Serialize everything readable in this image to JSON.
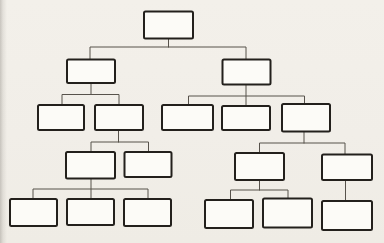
{
  "page": {
    "background_color": "#f1eee8",
    "scan_edge_shadow_color": "#b7b2aa"
  },
  "diagram": {
    "type": "tree",
    "title": "",
    "canvas": {
      "width": 384,
      "height": 243
    },
    "node_style": {
      "fill": "#fcfbf7",
      "stroke": "#23201c",
      "stroke_width": 2,
      "corner_radius": 1.5
    },
    "connector_style": {
      "stroke": "#57524b",
      "stroke_width": 1
    },
    "nodes": [
      {
        "id": "n1",
        "level": 1,
        "parent": null,
        "label": "",
        "x": 144,
        "y": 11.5,
        "w": 49,
        "h": 27
      },
      {
        "id": "n2",
        "level": 2,
        "parent": "n1",
        "label": "",
        "x": 67,
        "y": 59.5,
        "w": 48,
        "h": 23.5
      },
      {
        "id": "n3",
        "level": 2,
        "parent": "n1",
        "label": "",
        "x": 222.5,
        "y": 59.5,
        "w": 48,
        "h": 25
      },
      {
        "id": "n4",
        "level": 3,
        "parent": "n2",
        "label": "",
        "x": 38,
        "y": 105,
        "w": 46,
        "h": 25
      },
      {
        "id": "n5",
        "level": 3,
        "parent": "n2",
        "label": "",
        "x": 95,
        "y": 105,
        "w": 48,
        "h": 25
      },
      {
        "id": "n6",
        "level": 3,
        "parent": "n3",
        "label": "",
        "x": 162,
        "y": 105,
        "w": 51,
        "h": 25
      },
      {
        "id": "n7",
        "level": 3,
        "parent": "n3",
        "label": "",
        "x": 222,
        "y": 106,
        "w": 48,
        "h": 24
      },
      {
        "id": "n8",
        "level": 3,
        "parent": "n3",
        "label": "",
        "x": 282,
        "y": 104,
        "w": 48,
        "h": 27.5
      },
      {
        "id": "n9",
        "level": 4,
        "parent": "n5",
        "label": "",
        "x": 66,
        "y": 152,
        "w": 49,
        "h": 26.5
      },
      {
        "id": "n10",
        "level": 4,
        "parent": "n5",
        "label": "",
        "x": 124.5,
        "y": 152,
        "w": 47,
        "h": 25
      },
      {
        "id": "n11",
        "level": 4,
        "parent": "n8",
        "label": "",
        "x": 235,
        "y": 153,
        "w": 49,
        "h": 27
      },
      {
        "id": "n12",
        "level": 4,
        "parent": "n8",
        "label": "",
        "x": 322,
        "y": 154.5,
        "w": 50,
        "h": 25.5
      },
      {
        "id": "n13",
        "level": 5,
        "parent": "n9",
        "label": "",
        "x": 10,
        "y": 199,
        "w": 47,
        "h": 27
      },
      {
        "id": "n14",
        "level": 5,
        "parent": "n9",
        "label": "",
        "x": 67,
        "y": 199,
        "w": 47,
        "h": 26
      },
      {
        "id": "n15",
        "level": 5,
        "parent": "n9",
        "label": "",
        "x": 124,
        "y": 199,
        "w": 47,
        "h": 27
      },
      {
        "id": "n16",
        "level": 5,
        "parent": "n11",
        "label": "",
        "x": 205,
        "y": 200,
        "w": 48,
        "h": 28
      },
      {
        "id": "n17",
        "level": 5,
        "parent": "n11",
        "label": "",
        "x": 263,
        "y": 198.5,
        "w": 49,
        "h": 29
      },
      {
        "id": "n18",
        "level": 5,
        "parent": "n12",
        "label": "",
        "x": 322,
        "y": 201,
        "w": 50,
        "h": 29
      }
    ],
    "connectors": [
      {
        "name": "root-stem",
        "points": [
          [
            168.5,
            38.5
          ],
          [
            168.5,
            47
          ]
        ]
      },
      {
        "name": "root-bar",
        "points": [
          [
            90,
            59.5
          ],
          [
            90,
            47
          ],
          [
            246,
            47
          ],
          [
            246,
            59.5
          ]
        ]
      },
      {
        "name": "left2-stem",
        "points": [
          [
            91,
            83
          ],
          [
            91,
            94.5
          ]
        ]
      },
      {
        "name": "left2-bar",
        "points": [
          [
            62,
            105
          ],
          [
            62,
            94.5
          ],
          [
            119,
            94.5
          ],
          [
            119,
            105
          ]
        ]
      },
      {
        "name": "right2-stem",
        "points": [
          [
            246,
            84.5
          ],
          [
            246,
            106
          ]
        ]
      },
      {
        "name": "right2-bar",
        "points": [
          [
            188.5,
            105
          ],
          [
            188.5,
            96
          ],
          [
            304.5,
            96
          ],
          [
            304.5,
            104
          ]
        ]
      },
      {
        "name": "left3-stem",
        "points": [
          [
            118.5,
            130
          ],
          [
            118.5,
            142
          ]
        ]
      },
      {
        "name": "left3-bar",
        "points": [
          [
            91,
            152
          ],
          [
            91,
            142
          ],
          [
            148.5,
            142
          ],
          [
            148.5,
            152
          ]
        ]
      },
      {
        "name": "right3-stem",
        "points": [
          [
            304,
            131.5
          ],
          [
            304,
            143
          ]
        ]
      },
      {
        "name": "right3-bar",
        "points": [
          [
            259.5,
            153
          ],
          [
            259.5,
            143
          ],
          [
            345,
            143
          ],
          [
            345,
            154.5
          ]
        ]
      },
      {
        "name": "left4-stem",
        "points": [
          [
            91,
            178.5
          ],
          [
            91,
            199
          ]
        ]
      },
      {
        "name": "left4-bar",
        "points": [
          [
            33,
            199
          ],
          [
            33,
            189
          ],
          [
            148,
            189
          ],
          [
            148,
            199
          ]
        ]
      },
      {
        "name": "right4-stem",
        "points": [
          [
            259.5,
            180
          ],
          [
            259.5,
            190
          ]
        ]
      },
      {
        "name": "right4-bar",
        "points": [
          [
            230.5,
            200
          ],
          [
            230.5,
            190
          ],
          [
            288,
            190
          ],
          [
            288,
            198.5
          ]
        ]
      },
      {
        "name": "right4-single",
        "points": [
          [
            345.5,
            180
          ],
          [
            345.5,
            201
          ]
        ]
      }
    ]
  }
}
